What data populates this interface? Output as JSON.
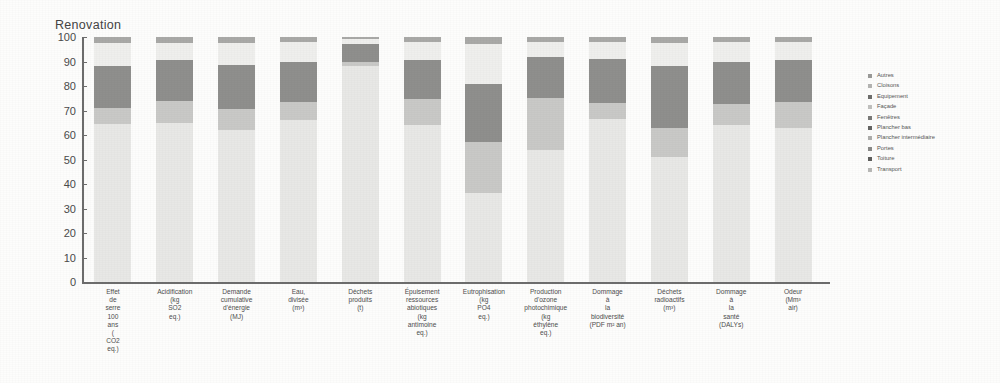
{
  "chart_data": {
    "type": "bar",
    "title": "Renovation",
    "subtitle": "",
    "xlabel": "",
    "ylabel": "",
    "ylim": [
      0,
      100
    ],
    "yticks": [
      0,
      10,
      20,
      30,
      40,
      50,
      60,
      70,
      80,
      90,
      100
    ],
    "grid": false,
    "stacked": true,
    "stack_mode": "percent",
    "legend_position": "right",
    "categories": [
      "Effet de serre 100 ans (kg CO2 eq.)",
      "Acidification (kg SO2 eq.)",
      "Demande cumulative d'énergie (MJ)",
      "Eau, divisée (m³)",
      "Déchets produits (t)",
      "Épuisement ressources abiotiques (kg antimoine eq.)",
      "Eutrophisation (kg PO4 eq.)",
      "Production d'ozone photochimique (kg éthylène eq.)",
      "Dommage à la biodiversité (PDF m² an)",
      "Déchets radioactifs (m³)",
      "Dommage à la santé (DALYs)",
      "Odeur (Mm³ air)"
    ],
    "category_lines": [
      [
        "Effet",
        "de",
        "serre",
        "100",
        "ans",
        "(",
        "CO2",
        "eq.)"
      ],
      [
        "Acidification",
        "(kg",
        "SO2",
        "eq.)"
      ],
      [
        "Demande",
        "cumulative",
        "d'énergie",
        "(MJ)"
      ],
      [
        "Eau,",
        "divisée",
        "(m³)"
      ],
      [
        "Déchets",
        "produits",
        "(t)"
      ],
      [
        "Épuisement",
        "ressources",
        "abiotiques",
        "(kg",
        "antimoine",
        "eq.)"
      ],
      [
        "Eutrophisation",
        "(kg",
        "PO4",
        "eq.)"
      ],
      [
        "Production",
        "d'ozone",
        "photochimique",
        "(kg",
        "éthylène",
        "eq.)"
      ],
      [
        "Dommage",
        "à",
        "la",
        "biodiversité",
        "(PDF m² an)"
      ],
      [
        "Déchets",
        "radioactifs",
        "(m³)"
      ],
      [
        "Dommage",
        "à",
        "la",
        "santé",
        "(DALYs)"
      ],
      [
        "Odeur",
        "(Mm³",
        "air)"
      ]
    ],
    "series": [
      {
        "name": "Autres",
        "color": "#e8e8e6",
        "values": [
          64.5,
          65.0,
          62.0,
          66.0,
          88.0,
          64.0,
          36.5,
          54.0,
          66.5,
          51.0,
          64.0,
          63.0
        ]
      },
      {
        "name": "Cloisons",
        "color": "#c9c9c7",
        "values": [
          6.5,
          9.0,
          8.5,
          7.5,
          2.0,
          10.5,
          20.5,
          21.0,
          6.5,
          12.0,
          8.5,
          10.5
        ]
      },
      {
        "name": "Equipement",
        "color": "#8f8f8d",
        "values": [
          17.0,
          16.5,
          18.0,
          16.5,
          7.0,
          16.0,
          24.0,
          17.0,
          18.0,
          25.0,
          17.5,
          17.0
        ]
      },
      {
        "name": "Façade",
        "color": "#efefed",
        "values": [
          9.5,
          7.0,
          9.0,
          8.0,
          2.0,
          7.5,
          16.0,
          6.0,
          7.0,
          9.5,
          8.0,
          7.5
        ]
      },
      {
        "name": "Fenêtres",
        "color": "#a9a9a7",
        "values": [
          2.5,
          2.5,
          2.5,
          2.0,
          1.0,
          2.0,
          3.0,
          2.0,
          2.0,
          2.5,
          2.0,
          2.0
        ]
      }
    ],
    "legend_entries": [
      {
        "label": "Autres",
        "color": "#9a9a98"
      },
      {
        "label": "Cloisons",
        "color": "#b4b4b2"
      },
      {
        "label": "Equipement",
        "color": "#6e6e6c"
      },
      {
        "label": "Façade",
        "color": "#c0c0be"
      },
      {
        "label": "Fenêtres",
        "color": "#7a7a78"
      },
      {
        "label": "Plancher bas",
        "color": "#646462"
      },
      {
        "label": "Plancher intermédiaire",
        "color": "#aeaeac"
      },
      {
        "label": "Portes",
        "color": "#8a8a88"
      },
      {
        "label": "Toiture",
        "color": "#5e5e5c"
      },
      {
        "label": "Transport",
        "color": "#b8b8b6"
      }
    ]
  }
}
